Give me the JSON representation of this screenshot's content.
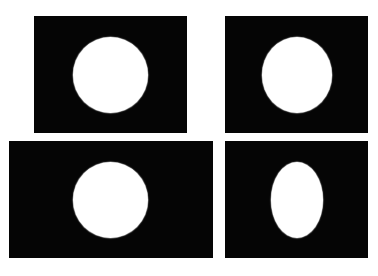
{
  "figure": {
    "title_fragment": "",
    "colors": {
      "background": "#ffffff",
      "frame": "#050505",
      "shape": "#ffffff"
    },
    "panels": [
      {
        "id": "top-left",
        "label": "4:3 frame, circle",
        "frame": {
          "x": 34,
          "y": 16,
          "w": 153,
          "h": 117
        },
        "shape": {
          "type": "circle",
          "cx": 110.5,
          "cy": 75,
          "w": 75,
          "h": 76
        }
      },
      {
        "id": "top-right",
        "label": "4:3 frame, slightly stretched ellipse",
        "frame": {
          "x": 225,
          "y": 16,
          "w": 143,
          "h": 117
        },
        "shape": {
          "type": "ellipse",
          "cx": 297,
          "cy": 75,
          "w": 70,
          "h": 76
        }
      },
      {
        "id": "bottom-left",
        "label": "wide frame, circle",
        "frame": {
          "x": 9,
          "y": 141,
          "w": 204,
          "h": 117
        },
        "shape": {
          "type": "circle",
          "cx": 110.5,
          "cy": 200,
          "w": 75,
          "h": 76
        }
      },
      {
        "id": "bottom-right",
        "label": "4:3 frame, squeezed ellipse",
        "frame": {
          "x": 225,
          "y": 141,
          "w": 143,
          "h": 117
        },
        "shape": {
          "type": "ellipse",
          "cx": 297,
          "cy": 200,
          "w": 52,
          "h": 76
        }
      }
    ]
  }
}
